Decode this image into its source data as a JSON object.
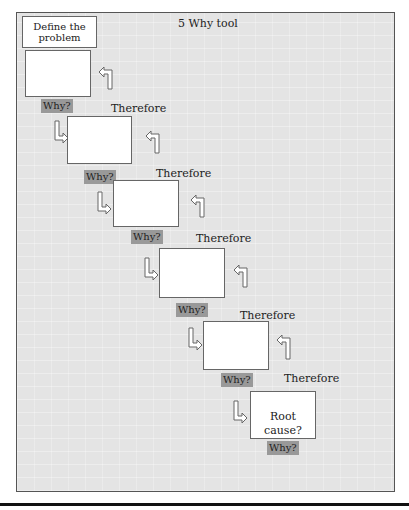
{
  "title": "5 Why tool",
  "define_label": "Define the problem",
  "steps": [
    {
      "why": "Why?",
      "therefore": "Therefore"
    },
    {
      "why": "Why?",
      "therefore": "Therefore"
    },
    {
      "why": "Why?",
      "therefore": "Therefore"
    },
    {
      "why": "Why?",
      "therefore": "Therefore"
    },
    {
      "why": "Why?",
      "therefore": "Therefore"
    }
  ],
  "root_cause": "Root cause?",
  "final_why": "Why?",
  "icons": {
    "down_right_arrow": "outlined-L-arrow-down-then-right",
    "up_left_arrow": "outlined-arrow-up-then-left"
  },
  "colors": {
    "panel_bg": "#e4e4e4",
    "why_tag": "#999999",
    "box": "#ffffff"
  }
}
